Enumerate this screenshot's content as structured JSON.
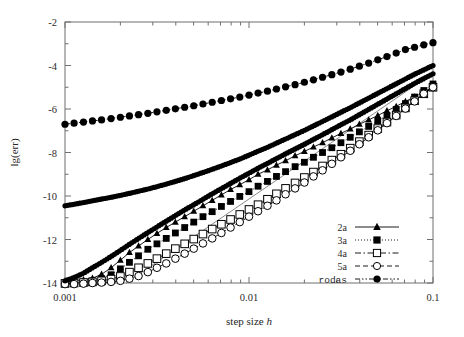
{
  "figure": {
    "background": "#ffffff",
    "ink": "#000000",
    "axis_color": "#6f6f6f"
  },
  "chart_data": {
    "type": "line",
    "title": "",
    "subtitle": "",
    "xlabel": "step size h",
    "xlabel_plain": "step size",
    "xlabel_italic": "h",
    "ylabel": "lg(err)",
    "xscale": "log",
    "yscale": "linear",
    "xlim": [
      0.001,
      0.1
    ],
    "ylim": [
      -14,
      -2
    ],
    "xticks": [
      0.001,
      0.01,
      0.1
    ],
    "xticklabels": [
      "0.001",
      "0.01",
      "0.1"
    ],
    "yticks": [
      -2,
      -4,
      -6,
      -8,
      -10,
      -12,
      -14
    ],
    "yticklabels": [
      "-2",
      "-4",
      "-6",
      "-8",
      "-10",
      "-12",
      "-14"
    ],
    "grid": false,
    "minor_ticks": true,
    "legend_position": "bottom-right",
    "annotations": [
      {
        "name": "reference-slope-line",
        "description": "thin straight reference line",
        "x": [
          0.00215,
          0.1
        ],
        "y": [
          -14.0,
          -4.35
        ]
      }
    ],
    "series": [
      {
        "name": "2a",
        "label": "2a",
        "marker": "filled-triangle",
        "linestyle": "solid",
        "marker_size": 3.2,
        "x": [
          0.001,
          0.00112,
          0.00126,
          0.00141,
          0.00158,
          0.00178,
          0.002,
          0.00224,
          0.00251,
          0.00282,
          0.00316,
          0.00355,
          0.00398,
          0.00447,
          0.00501,
          0.00562,
          0.00631,
          0.00708,
          0.00794,
          0.00891,
          0.01,
          0.0112,
          0.0126,
          0.0141,
          0.0158,
          0.0178,
          0.02,
          0.0224,
          0.0251,
          0.0282,
          0.0316,
          0.0355,
          0.0398,
          0.0447,
          0.0501,
          0.0562,
          0.0631,
          0.0708,
          0.0794,
          0.0891,
          0.1
        ],
        "y": [
          -13.95,
          -13.9,
          -13.85,
          -13.78,
          -13.6,
          -13.3,
          -12.95,
          -12.6,
          -12.3,
          -12.0,
          -11.72,
          -11.45,
          -11.2,
          -10.95,
          -10.7,
          -10.45,
          -10.2,
          -9.95,
          -9.7,
          -9.48,
          -9.25,
          -9.0,
          -8.8,
          -8.58,
          -8.38,
          -8.15,
          -7.95,
          -7.75,
          -7.55,
          -7.33,
          -7.12,
          -6.92,
          -6.7,
          -6.5,
          -6.3,
          -6.08,
          -5.88,
          -5.65,
          -5.45,
          -5.22,
          -5.0
        ],
        "description": "second order, rises from roundoff floor near -14 at h=0.001 to about -5.0 at h=0.1"
      },
      {
        "name": "3a",
        "label": "3a",
        "marker": "filled-square",
        "linestyle": "dotted",
        "marker_size": 3.4,
        "x": [
          0.001,
          0.00112,
          0.00126,
          0.00141,
          0.00158,
          0.00178,
          0.002,
          0.00224,
          0.00251,
          0.00282,
          0.00316,
          0.00355,
          0.00398,
          0.00447,
          0.00501,
          0.00562,
          0.00631,
          0.00708,
          0.00794,
          0.00891,
          0.01,
          0.0112,
          0.0126,
          0.0141,
          0.0158,
          0.0178,
          0.02,
          0.0224,
          0.0251,
          0.0282,
          0.0316,
          0.0355,
          0.0398,
          0.0447,
          0.0501,
          0.0562,
          0.0631,
          0.0708,
          0.0794,
          0.0891,
          0.1
        ],
        "y": [
          -14.0,
          -13.98,
          -13.95,
          -13.9,
          -13.8,
          -13.62,
          -13.35,
          -13.05,
          -12.75,
          -12.45,
          -12.2,
          -11.95,
          -11.7,
          -11.45,
          -11.2,
          -10.95,
          -10.72,
          -10.48,
          -10.25,
          -10.02,
          -9.8,
          -9.55,
          -9.33,
          -9.1,
          -8.88,
          -8.65,
          -8.45,
          -8.22,
          -8.0,
          -7.78,
          -7.55,
          -7.3,
          -7.05,
          -6.8,
          -6.55,
          -6.3,
          -6.02,
          -5.75,
          -5.45,
          -5.15,
          -4.85
        ],
        "description": "third order, rises from -14 floor to about -4.85 at h=0.1"
      },
      {
        "name": "4a",
        "label": "4a",
        "marker": "open-square",
        "linestyle": "dash-dot",
        "marker_size": 3.8,
        "x": [
          0.001,
          0.00112,
          0.00126,
          0.00141,
          0.00158,
          0.00178,
          0.002,
          0.00224,
          0.00251,
          0.00282,
          0.00316,
          0.00355,
          0.00398,
          0.00447,
          0.00501,
          0.00562,
          0.00631,
          0.00708,
          0.00794,
          0.00891,
          0.01,
          0.0112,
          0.0126,
          0.0141,
          0.0158,
          0.0178,
          0.02,
          0.0224,
          0.0251,
          0.0282,
          0.0316,
          0.0355,
          0.0398,
          0.0447,
          0.0501,
          0.0562,
          0.0631,
          0.0708,
          0.0794,
          0.0891,
          0.1
        ],
        "y": [
          -14.02,
          -14.0,
          -13.98,
          -13.95,
          -13.9,
          -13.82,
          -13.7,
          -13.5,
          -13.3,
          -13.1,
          -12.88,
          -12.65,
          -12.42,
          -12.2,
          -11.98,
          -11.75,
          -11.52,
          -11.3,
          -11.08,
          -10.85,
          -10.62,
          -10.4,
          -10.15,
          -9.9,
          -9.65,
          -9.4,
          -9.15,
          -8.9,
          -8.62,
          -8.35,
          -8.08,
          -7.8,
          -7.5,
          -7.2,
          -6.9,
          -6.6,
          -6.28,
          -5.95,
          -5.62,
          -5.3,
          -5.0
        ],
        "description": "fourth order, open squares, reaches about -5.0 at h=0.1"
      },
      {
        "name": "5a",
        "label": "5a",
        "marker": "open-circle",
        "linestyle": "dashed",
        "marker_size": 3.8,
        "x": [
          0.001,
          0.00112,
          0.00126,
          0.00141,
          0.00158,
          0.00178,
          0.002,
          0.00224,
          0.00251,
          0.00282,
          0.00316,
          0.00355,
          0.00398,
          0.00447,
          0.00501,
          0.00562,
          0.00631,
          0.00708,
          0.00794,
          0.00891,
          0.01,
          0.0112,
          0.0126,
          0.0141,
          0.0158,
          0.0178,
          0.02,
          0.0224,
          0.0251,
          0.0282,
          0.0316,
          0.0355,
          0.0398,
          0.0447,
          0.0501,
          0.0562,
          0.0631,
          0.0708,
          0.0794,
          0.0891,
          0.1
        ],
        "y": [
          -14.05,
          -14.05,
          -14.03,
          -14.0,
          -13.98,
          -13.95,
          -13.9,
          -13.8,
          -13.68,
          -13.5,
          -13.3,
          -13.1,
          -12.88,
          -12.65,
          -12.42,
          -12.18,
          -11.95,
          -11.7,
          -11.45,
          -11.2,
          -10.95,
          -10.7,
          -10.45,
          -10.2,
          -9.92,
          -9.65,
          -9.38,
          -9.1,
          -8.82,
          -8.52,
          -8.22,
          -7.92,
          -7.62,
          -7.3,
          -6.98,
          -6.65,
          -6.32,
          -5.98,
          -5.65,
          -5.3,
          -5.0
        ],
        "description": "fifth order, open circles, steepest of the a-family, reaches about -5.0 at h=0.1"
      },
      {
        "name": "rodas",
        "label": "rodas",
        "marker": "filled-circle",
        "linestyle": "dash-dot-dot",
        "marker_size": 3.6,
        "x": [
          0.001,
          0.00112,
          0.00126,
          0.00141,
          0.00158,
          0.00178,
          0.002,
          0.00224,
          0.00251,
          0.00282,
          0.00316,
          0.00355,
          0.00398,
          0.00447,
          0.00501,
          0.00562,
          0.00631,
          0.00708,
          0.00794,
          0.00891,
          0.01,
          0.0112,
          0.0126,
          0.0141,
          0.0158,
          0.0178,
          0.02,
          0.0224,
          0.0251,
          0.0282,
          0.0316,
          0.0355,
          0.0398,
          0.0447,
          0.0501,
          0.0562,
          0.0631,
          0.0708,
          0.0794,
          0.0891,
          0.1
        ],
        "y": [
          -6.7,
          -6.65,
          -6.6,
          -6.55,
          -6.5,
          -6.44,
          -6.38,
          -6.32,
          -6.26,
          -6.2,
          -6.13,
          -6.06,
          -5.99,
          -5.92,
          -5.85,
          -5.77,
          -5.69,
          -5.61,
          -5.53,
          -5.45,
          -5.36,
          -5.27,
          -5.18,
          -5.08,
          -4.98,
          -4.88,
          -4.77,
          -4.66,
          -4.54,
          -4.42,
          -4.3,
          -4.17,
          -4.03,
          -3.89,
          -3.74,
          -3.59,
          -3.43,
          -3.27,
          -3.16,
          -3.05,
          -2.95
        ],
        "description": "top curve with shallow slope, from about -6.7 at h=0.001 to about -2.95 at h=0.1"
      },
      {
        "name": "unlabeled-dense-lower",
        "label": "",
        "marker": "filled-circle",
        "linestyle": "solid",
        "marker_size": 2.6,
        "hidden_from_legend": true,
        "x": [
          0.001,
          0.00112,
          0.00126,
          0.00141,
          0.00158,
          0.00178,
          0.002,
          0.00224,
          0.00251,
          0.00282,
          0.00316,
          0.00355,
          0.00398,
          0.00447,
          0.00501,
          0.00562,
          0.00631,
          0.00708,
          0.00794,
          0.00891,
          0.01,
          0.0112,
          0.0126,
          0.0141,
          0.0158,
          0.0178,
          0.02,
          0.0224,
          0.0251,
          0.0282,
          0.0316,
          0.0355,
          0.0398,
          0.0447,
          0.0501,
          0.0562,
          0.0631,
          0.0708,
          0.0794,
          0.0891,
          0.1
        ],
        "y": [
          -10.45,
          -10.38,
          -10.3,
          -10.22,
          -10.14,
          -10.06,
          -9.97,
          -9.88,
          -9.78,
          -9.68,
          -9.57,
          -9.45,
          -9.33,
          -9.2,
          -9.06,
          -8.92,
          -8.77,
          -8.62,
          -8.46,
          -8.3,
          -8.12,
          -7.94,
          -7.76,
          -7.57,
          -7.38,
          -7.18,
          -6.98,
          -6.78,
          -6.57,
          -6.36,
          -6.15,
          -5.94,
          -5.72,
          -5.5,
          -5.28,
          -5.06,
          -4.84,
          -4.62,
          -4.4,
          -4.2,
          -4.0
        ],
        "description": "dense second branch starting near -10.45 at h=0.001, curving up to about -4.0"
      },
      {
        "name": "unlabeled-dense-steep",
        "label": "",
        "marker": "filled-circle",
        "linestyle": "solid",
        "marker_size": 2.6,
        "hidden_from_legend": true,
        "x": [
          0.001,
          0.00112,
          0.00126,
          0.00141,
          0.00158,
          0.00178,
          0.002,
          0.00224,
          0.00251,
          0.00282,
          0.00316,
          0.00355,
          0.00398,
          0.00447,
          0.00501,
          0.00562,
          0.00631,
          0.00708,
          0.00794,
          0.00891,
          0.01,
          0.0112,
          0.0126,
          0.0141,
          0.0158,
          0.0178,
          0.02,
          0.0224,
          0.0251,
          0.0282,
          0.0316,
          0.0355,
          0.0398,
          0.0447,
          0.0501,
          0.0562,
          0.0631,
          0.0708,
          0.0794,
          0.0891,
          0.1
        ],
        "y": [
          -13.9,
          -13.75,
          -13.55,
          -13.3,
          -13.05,
          -12.78,
          -12.5,
          -12.22,
          -11.95,
          -11.68,
          -11.42,
          -11.16,
          -10.9,
          -10.64,
          -10.4,
          -10.15,
          -9.9,
          -9.66,
          -9.42,
          -9.18,
          -8.95,
          -8.72,
          -8.5,
          -8.28,
          -8.06,
          -7.84,
          -7.62,
          -7.4,
          -7.18,
          -6.95,
          -6.72,
          -6.5,
          -6.26,
          -6.02,
          -5.78,
          -5.54,
          -5.3,
          -5.06,
          -4.82,
          -4.6,
          -4.38
        ],
        "description": "dense steep branch rising from the -14 roundoff floor"
      }
    ]
  },
  "legend": {
    "entries": [
      {
        "label": "2a",
        "marker": "filled-triangle",
        "linestyle": "solid",
        "mono": false
      },
      {
        "label": "3a",
        "marker": "filled-square",
        "linestyle": "dotted",
        "mono": false
      },
      {
        "label": "4a",
        "marker": "open-square",
        "linestyle": "dash-dot",
        "mono": false
      },
      {
        "label": "5a",
        "marker": "open-circle",
        "linestyle": "dashed",
        "mono": false
      },
      {
        "label": "rodas",
        "marker": "filled-circle",
        "linestyle": "dash-dot-dot",
        "mono": true
      }
    ]
  }
}
